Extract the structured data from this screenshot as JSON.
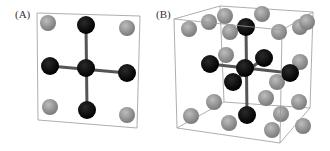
{
  "panels": [
    {
      "label": "(A)",
      "box": {
        "front": [
          [
            37,
            13
          ],
          [
            140,
            16
          ],
          [
            137,
            128
          ],
          [
            38,
            120
          ]
        ]
      },
      "bonds": [
        [
          86,
          25,
          87,
          110
        ],
        [
          50,
          66,
          127,
          73
        ]
      ],
      "gray_atoms": [
        [
          48,
          23
        ],
        [
          127,
          28
        ],
        [
          50,
          107
        ],
        [
          127,
          115
        ]
      ],
      "black_atoms": [
        [
          86,
          25
        ],
        [
          50,
          66
        ],
        [
          127,
          73
        ],
        [
          87,
          110
        ],
        [
          86,
          68
        ]
      ]
    },
    {
      "label": "(B)",
      "box": {
        "back": [
          [
            220,
            6
          ],
          [
            313,
            12
          ],
          [
            310,
            108
          ],
          [
            224,
            102
          ]
        ],
        "front": [
          [
            174,
            19
          ],
          [
            282,
            30
          ],
          [
            280,
            143
          ],
          [
            177,
            128
          ]
        ]
      },
      "bonds": [
        [
          246,
          27,
          247,
          115
        ],
        [
          210,
          64,
          290,
          73
        ],
        [
          233,
          82,
          264,
          58
        ]
      ],
      "gray_atoms": [
        [
          189,
          29
        ],
        [
          209,
          22
        ],
        [
          225,
          16
        ],
        [
          230,
          32
        ],
        [
          262,
          14
        ],
        [
          279,
          32
        ],
        [
          300,
          27
        ],
        [
          307,
          22
        ],
        [
          226,
          55
        ],
        [
          300,
          62
        ],
        [
          277,
          82
        ],
        [
          266,
          98
        ],
        [
          299,
          102
        ],
        [
          214,
          102
        ],
        [
          191,
          116
        ],
        [
          229,
          123
        ],
        [
          281,
          114
        ],
        [
          303,
          126
        ],
        [
          272,
          130
        ]
      ],
      "black_atoms": [
        [
          246,
          27
        ],
        [
          210,
          64
        ],
        [
          264,
          58
        ],
        [
          290,
          73
        ],
        [
          233,
          82
        ],
        [
          247,
          115
        ],
        [
          245,
          68
        ]
      ]
    }
  ],
  "colors": {
    "gray_atom": "#8a8a8a",
    "black_atom": "#0a0a0a",
    "bond": "#555555",
    "box": "#999999"
  }
}
